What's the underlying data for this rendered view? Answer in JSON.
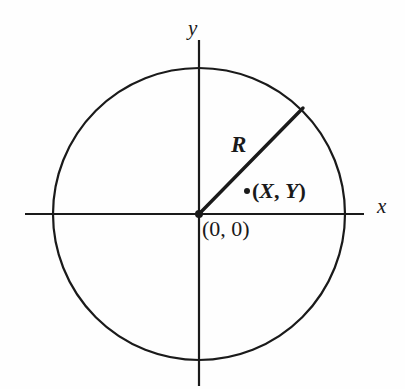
{
  "figure": {
    "background_color": "#fefefe",
    "stroke_color": "#1a1a1a"
  },
  "labels": {
    "y_axis": "y",
    "x_axis": "x",
    "radius": "R",
    "point": "(X, Y)",
    "point_open_paren": "(",
    "point_x": "X",
    "point_comma": ", ",
    "point_y": "Y",
    "point_close_paren": ")",
    "origin": "(0, 0)"
  },
  "geometry": {
    "center_x": 199,
    "center_y": 214,
    "radius": 146,
    "x_axis_start": 25,
    "x_axis_end": 364,
    "y_axis_start": 40,
    "y_axis_end": 386,
    "radius_line_end_x": 303,
    "radius_line_end_y": 108,
    "point_marker_x": 247,
    "point_marker_y": 191,
    "point_marker_radius": 3,
    "origin_marker_radius": 4,
    "circle_stroke_width": 2.2,
    "axis_stroke_width": 2.2,
    "radius_stroke_width": 3.4
  }
}
